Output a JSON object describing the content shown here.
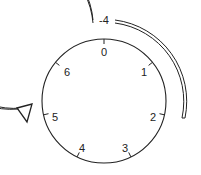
{
  "diagram": {
    "rotation_label": "-4",
    "positions": [
      {
        "label": "0",
        "index": 0
      },
      {
        "label": "1",
        "index": 1
      },
      {
        "label": "2",
        "index": 2
      },
      {
        "label": "3",
        "index": 3
      },
      {
        "label": "4",
        "index": 4
      },
      {
        "label": "5",
        "index": 5
      },
      {
        "label": "6",
        "index": 6
      }
    ],
    "arrow_direction": "counterclockwise",
    "colors": {
      "stroke": "#222222",
      "background": "#ffffff"
    }
  }
}
